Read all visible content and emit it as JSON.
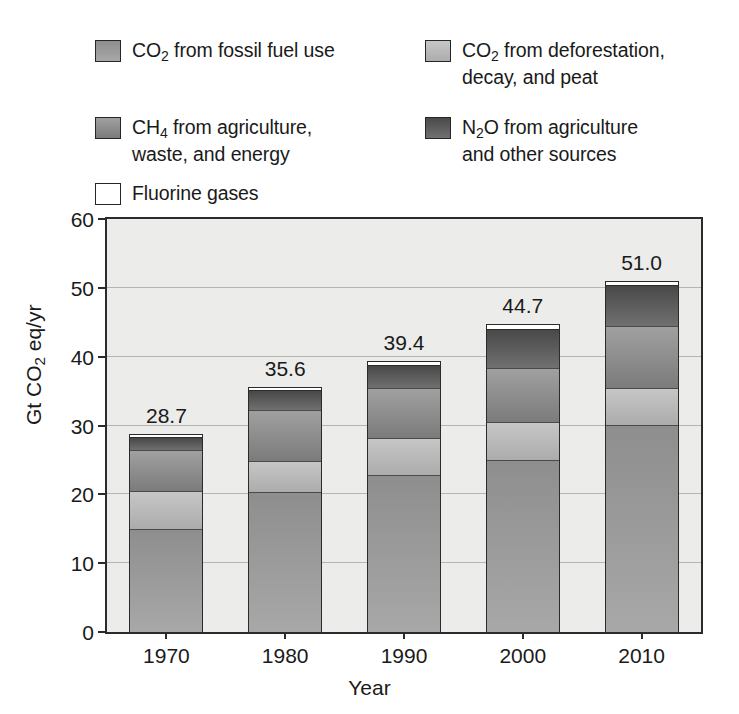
{
  "legend": {
    "entries": [
      {
        "key": "co2_fossil",
        "label_html": "CO<sub>2</sub> from fossil fuel use",
        "label": "CO2 from fossil fuel use",
        "color": "#9a9a9a",
        "color_top": "#8e8e8e",
        "color_bottom": "#a8a8a8",
        "swatch": "filled"
      },
      {
        "key": "co2_defor",
        "label_html": "CO<sub>2</sub> from deforestation,\ndecay, and peat",
        "label": "CO2 from deforestation, decay, and peat",
        "color": "#b9b9b9",
        "color_top": "#c6c6c6",
        "color_bottom": "#acacac",
        "swatch": "filled"
      },
      {
        "key": "ch4",
        "label_html": "CH<sub>4</sub> from agriculture,\nwaste, and energy",
        "label": "CH4 from agriculture, waste, and energy",
        "color": "#8c8c8c",
        "color_top": "#a0a0a0",
        "color_bottom": "#7b7b7b",
        "swatch": "filled"
      },
      {
        "key": "n2o",
        "label_html": "N<sub>2</sub>O from agriculture\nand other sources",
        "label": "N2O from agriculture and other sources",
        "color": "#5f5f5f",
        "color_top": "#4a4a4a",
        "color_bottom": "#707070",
        "swatch": "filled"
      },
      {
        "key": "fluorine",
        "label_html": "Fluorine gases",
        "label": "Fluorine gases",
        "color": "#ffffff",
        "color_top": "#ffffff",
        "color_bottom": "#ffffff",
        "swatch": "outline"
      }
    ]
  },
  "chart_data": {
    "type": "bar",
    "subtype": "stacked",
    "title": "",
    "xlabel": "Year",
    "ylabel": "Gt CO2 eq/yr",
    "ylabel_html": "Gt CO<sub>2</sub> eq/yr",
    "categories": [
      "1970",
      "1980",
      "1990",
      "2000",
      "2010"
    ],
    "ylim": [
      0,
      60
    ],
    "yticks": [
      0,
      10,
      20,
      30,
      40,
      50,
      60
    ],
    "ytick_labels": [
      "0",
      "10",
      "20",
      "30",
      "40",
      "50",
      "60"
    ],
    "grid": true,
    "grid_axis": "y",
    "legend_position": "above-plot",
    "totals": [
      28.7,
      35.6,
      39.4,
      44.7,
      51.0
    ],
    "total_labels": [
      "28.7",
      "35.6",
      "39.4",
      "44.7",
      "51.0"
    ],
    "series": [
      {
        "name": "CO2 from fossil fuel use",
        "key": "co2_fossil",
        "color": "#9a9a9a",
        "values": [
          15.0,
          20.3,
          22.8,
          25.0,
          30.0
        ]
      },
      {
        "name": "CO2 from deforestation, decay, and peat",
        "key": "co2_defor",
        "color": "#b9b9b9",
        "values": [
          5.5,
          4.5,
          5.4,
          5.5,
          5.5
        ]
      },
      {
        "name": "CH4 from agriculture, waste, and energy",
        "key": "ch4",
        "color": "#8c8c8c",
        "values": [
          6.0,
          7.4,
          7.3,
          7.8,
          9.0
        ]
      },
      {
        "name": "N2O from agriculture and other sources",
        "key": "n2o",
        "color": "#5f5f5f",
        "values": [
          1.7,
          2.8,
          3.2,
          5.6,
          5.7
        ]
      },
      {
        "name": "Fluorine gases",
        "key": "fluorine",
        "color": "#ffffff",
        "values": [
          0.5,
          0.6,
          0.7,
          0.8,
          0.8
        ]
      }
    ]
  },
  "style": {
    "plot_background": "#ececea",
    "frame_color": "#2b2b2b",
    "grid_color": "#b4b4b0",
    "text_color": "#1a1a1a",
    "page_background": "#ffffff"
  }
}
